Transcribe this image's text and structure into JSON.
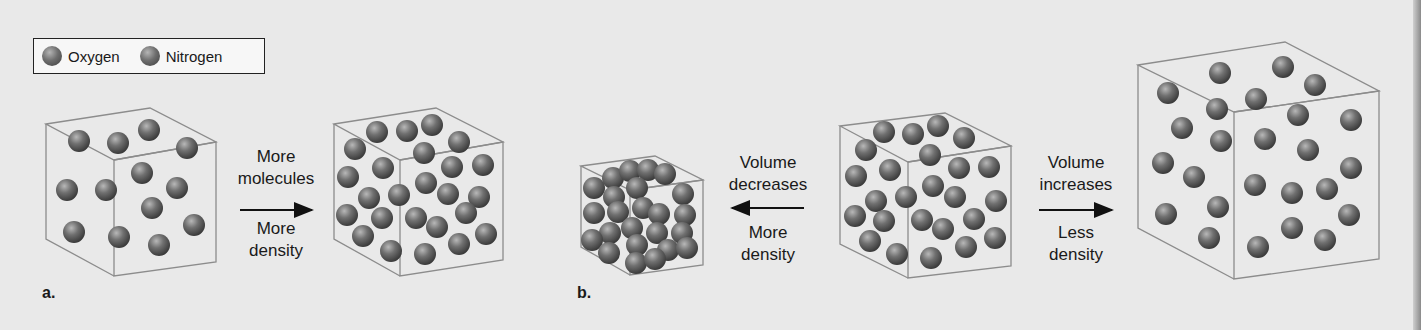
{
  "legend": {
    "items": [
      {
        "label": "Oxygen",
        "icon": "sphere-icon"
      },
      {
        "label": "Nitrogen",
        "icon": "sphere-icon"
      }
    ]
  },
  "panel_a": {
    "label": "a.",
    "arrow_top": [
      "More",
      "molecules"
    ],
    "arrow_bottom": [
      "More",
      "density"
    ],
    "arrow_direction": "right"
  },
  "panel_b": {
    "label": "b.",
    "left_arrow_top": [
      "Volume",
      "decreases"
    ],
    "left_arrow_bottom": [
      "More",
      "density"
    ],
    "left_arrow_direction": "left",
    "right_arrow_top": [
      "Volume",
      "increases"
    ],
    "right_arrow_bottom": [
      "Less",
      "density"
    ],
    "right_arrow_direction": "right"
  },
  "colors": {
    "background": "#e9e9e9",
    "cube_edge": "#8c8c8c",
    "sphere_dark": "#3c3c3c",
    "sphere_light": "#b5b5b5"
  }
}
